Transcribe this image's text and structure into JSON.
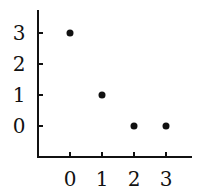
{
  "chart_data": {
    "type": "scatter",
    "title": "",
    "xlabel": "",
    "ylabel": "",
    "x": [
      0,
      1,
      2,
      3
    ],
    "y": [
      3,
      1,
      0,
      0
    ],
    "xticks": [
      "0",
      "1",
      "2",
      "3"
    ],
    "yticks": [
      "0",
      "1",
      "2",
      "3"
    ],
    "xlim": [
      -1,
      3.8
    ],
    "ylim": [
      -1,
      3.8
    ],
    "grid": false,
    "legend": null,
    "marker_color": "#111111",
    "axis_color": "#111111"
  }
}
